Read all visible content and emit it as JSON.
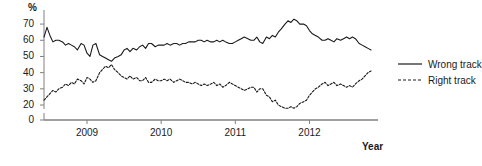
{
  "chart_data": {
    "type": "line",
    "title": "",
    "subtitle": "",
    "xlabel": "Year",
    "ylabel": "%",
    "ylim": [
      20,
      75
    ],
    "yticks": [
      20,
      30,
      40,
      50,
      60,
      70
    ],
    "y_axis_break": true,
    "y_break_tick": 0,
    "xlim": [
      2008.42,
      2012.83
    ],
    "xticks": [
      2009,
      2010,
      2011,
      2012
    ],
    "xtick_labels": [
      "2009",
      "2010",
      "2011",
      "2012"
    ],
    "grid": false,
    "legend_position": "right",
    "legend": [
      "Wrong track",
      "Right track"
    ],
    "series": [
      {
        "name": "Wrong track",
        "style": "solid",
        "color": "#1a1a1a",
        "x": [
          2008.42,
          2008.46,
          2008.5,
          2008.54,
          2008.58,
          2008.62,
          2008.67,
          2008.71,
          2008.75,
          2008.79,
          2008.83,
          2008.87,
          2008.92,
          2008.96,
          2009.0,
          2009.04,
          2009.08,
          2009.12,
          2009.17,
          2009.21,
          2009.25,
          2009.29,
          2009.33,
          2009.37,
          2009.42,
          2009.46,
          2009.5,
          2009.54,
          2009.58,
          2009.62,
          2009.67,
          2009.71,
          2009.75,
          2009.79,
          2009.83,
          2009.87,
          2009.92,
          2009.96,
          2010.0,
          2010.04,
          2010.08,
          2010.12,
          2010.17,
          2010.21,
          2010.25,
          2010.29,
          2010.33,
          2010.37,
          2010.42,
          2010.46,
          2010.5,
          2010.54,
          2010.58,
          2010.62,
          2010.67,
          2010.71,
          2010.75,
          2010.79,
          2010.83,
          2010.87,
          2010.92,
          2010.96,
          2011.0,
          2011.04,
          2011.08,
          2011.12,
          2011.17,
          2011.21,
          2011.25,
          2011.29,
          2011.33,
          2011.37,
          2011.42,
          2011.46,
          2011.5,
          2011.54,
          2011.58,
          2011.62,
          2011.67,
          2011.71,
          2011.75,
          2011.79,
          2011.83,
          2011.87,
          2011.92,
          2011.96,
          2012.0,
          2012.04,
          2012.08,
          2012.12,
          2012.17,
          2012.21,
          2012.25,
          2012.29,
          2012.33,
          2012.37,
          2012.42,
          2012.46,
          2012.5,
          2012.54,
          2012.58,
          2012.62,
          2012.67,
          2012.71,
          2012.75,
          2012.79,
          2012.83
        ],
        "values": [
          62,
          68,
          63,
          59,
          60,
          60,
          59,
          57,
          58,
          57,
          56,
          54,
          58,
          57,
          52,
          50,
          57,
          58,
          51,
          50,
          49,
          48,
          47,
          49,
          50,
          51,
          54,
          55,
          53,
          55,
          54,
          56,
          57,
          55,
          58,
          58,
          56,
          57,
          57,
          57,
          58,
          57,
          58,
          58,
          57,
          58,
          58,
          59,
          59,
          59,
          60,
          60,
          59,
          60,
          59,
          59,
          60,
          59,
          60,
          59,
          58,
          58,
          59,
          60,
          61,
          62,
          61,
          60,
          60,
          62,
          59,
          58,
          62,
          61,
          63,
          62,
          65,
          67,
          70,
          72,
          71,
          73,
          72,
          70,
          70,
          69,
          66,
          64,
          63,
          62,
          60,
          60,
          61,
          60,
          59,
          61,
          60,
          61,
          62,
          61,
          62,
          61,
          58,
          57,
          56,
          55,
          54
        ]
      },
      {
        "name": "Right track",
        "style": "dashed",
        "color": "#1a1a1a",
        "x": [
          2008.42,
          2008.46,
          2008.5,
          2008.54,
          2008.58,
          2008.62,
          2008.67,
          2008.71,
          2008.75,
          2008.79,
          2008.83,
          2008.87,
          2008.92,
          2008.96,
          2009.0,
          2009.04,
          2009.08,
          2009.12,
          2009.17,
          2009.21,
          2009.25,
          2009.29,
          2009.33,
          2009.37,
          2009.42,
          2009.46,
          2009.5,
          2009.54,
          2009.58,
          2009.62,
          2009.67,
          2009.71,
          2009.75,
          2009.79,
          2009.83,
          2009.87,
          2009.92,
          2009.96,
          2010.0,
          2010.04,
          2010.08,
          2010.12,
          2010.17,
          2010.21,
          2010.25,
          2010.29,
          2010.33,
          2010.37,
          2010.42,
          2010.46,
          2010.5,
          2010.54,
          2010.58,
          2010.62,
          2010.67,
          2010.71,
          2010.75,
          2010.79,
          2010.83,
          2010.87,
          2010.92,
          2010.96,
          2011.0,
          2011.04,
          2011.08,
          2011.12,
          2011.17,
          2011.21,
          2011.25,
          2011.29,
          2011.33,
          2011.37,
          2011.42,
          2011.46,
          2011.5,
          2011.54,
          2011.58,
          2011.62,
          2011.67,
          2011.71,
          2011.75,
          2011.79,
          2011.83,
          2011.87,
          2011.92,
          2011.96,
          2012.0,
          2012.04,
          2012.08,
          2012.12,
          2012.17,
          2012.21,
          2012.25,
          2012.29,
          2012.33,
          2012.37,
          2012.42,
          2012.46,
          2012.5,
          2012.54,
          2012.58,
          2012.62,
          2012.67,
          2012.71,
          2012.75,
          2012.79,
          2012.83
        ],
        "values": [
          23,
          25,
          27,
          29,
          28,
          30,
          31,
          33,
          32,
          34,
          33,
          36,
          35,
          33,
          37,
          36,
          34,
          35,
          40,
          42,
          44,
          43,
          45,
          42,
          40,
          38,
          37,
          36,
          38,
          36,
          37,
          35,
          35,
          37,
          34,
          34,
          36,
          35,
          35,
          36,
          35,
          36,
          34,
          35,
          36,
          35,
          34,
          34,
          33,
          34,
          33,
          32,
          33,
          32,
          33,
          34,
          32,
          33,
          31,
          32,
          34,
          33,
          32,
          31,
          30,
          29,
          30,
          31,
          31,
          28,
          30,
          30,
          26,
          25,
          22,
          23,
          20,
          19,
          18,
          18,
          19,
          18,
          19,
          21,
          22,
          23,
          26,
          28,
          30,
          31,
          33,
          34,
          32,
          33,
          34,
          32,
          33,
          32,
          31,
          32,
          31,
          33,
          35,
          36,
          38,
          40,
          41
        ]
      }
    ]
  },
  "axes": {
    "y_unit": "%",
    "y_labels": [
      "70",
      "60",
      "50",
      "40",
      "30",
      "20",
      "0"
    ],
    "x_labels": [
      "2009",
      "2010",
      "2011",
      "2012"
    ],
    "x_title": "Year"
  },
  "legend": {
    "items": [
      {
        "label": "Wrong track",
        "style": "solid"
      },
      {
        "label": "Right track",
        "style": "dashed"
      }
    ]
  },
  "colors": {
    "line": "#1a1a1a",
    "axis": "#808080",
    "background": "#ffffff"
  }
}
